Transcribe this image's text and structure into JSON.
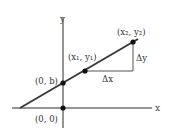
{
  "diagram": {
    "colors": {
      "line": "#3a3a3a",
      "axis": "#2a2a2a",
      "point": "#111111",
      "text": "#333333"
    },
    "axes": {
      "x_label": "x",
      "y_label": "y"
    },
    "points": {
      "origin": "(0, 0)",
      "intercept": "(0, b)",
      "p1": "(x₁, y₁)",
      "p2": "(x₂, y₂)"
    },
    "deltas": {
      "dx": "Δx",
      "dy": "Δy"
    }
  }
}
